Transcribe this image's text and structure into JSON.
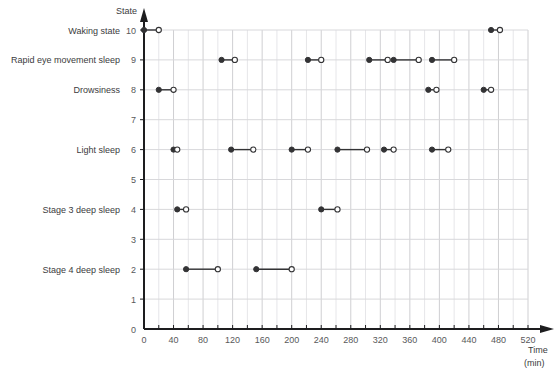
{
  "chart_data": {
    "type": "line",
    "title": "",
    "xlabel": "Time (min)",
    "ylabel": "State",
    "xlim": [
      0,
      520
    ],
    "ylim": [
      0,
      10
    ],
    "grid": true,
    "legend": "none",
    "x_major_step": 40,
    "x_minor_step": 20,
    "y_step": 1,
    "x_ticks": [
      0,
      40,
      80,
      120,
      160,
      200,
      240,
      280,
      320,
      360,
      400,
      440,
      480,
      520
    ],
    "x_tick_labels": [
      "0",
      "40",
      "80",
      "120",
      "160",
      "200",
      "240",
      "280",
      "320",
      "360",
      "400",
      "440",
      "480",
      "520"
    ],
    "y_ticks": [
      1,
      2,
      3,
      4,
      5,
      6,
      7,
      8,
      9,
      10
    ],
    "y_tick_labels": [
      "1",
      "2",
      "3",
      "4",
      "5",
      "6",
      "7",
      "8",
      "9",
      "10"
    ],
    "y_state_labels": [
      {
        "value": 10,
        "label": "Waking state"
      },
      {
        "value": 9,
        "label": "Rapid eye movement sleep"
      },
      {
        "value": 8,
        "label": "Drowsiness"
      },
      {
        "value": 6,
        "label": "Light sleep"
      },
      {
        "value": 4,
        "label": "Stage 3 deep sleep"
      },
      {
        "value": 2,
        "label": "Stage 4 deep sleep"
      }
    ],
    "marker_style": {
      "start": "filled-circle",
      "end": "open-circle",
      "color": "#333335",
      "line_color": "#333335"
    },
    "segments": [
      {
        "state": 10,
        "x_start": 0,
        "x_end": 20
      },
      {
        "state": 8,
        "x_start": 20,
        "x_end": 40
      },
      {
        "state": 6,
        "x_start": 40,
        "x_end": 45
      },
      {
        "state": 4,
        "x_start": 45,
        "x_end": 57
      },
      {
        "state": 2,
        "x_start": 57,
        "x_end": 100
      },
      {
        "state": 9,
        "x_start": 105,
        "x_end": 123
      },
      {
        "state": 6,
        "x_start": 118,
        "x_end": 148
      },
      {
        "state": 2,
        "x_start": 152,
        "x_end": 200
      },
      {
        "state": 6,
        "x_start": 200,
        "x_end": 222
      },
      {
        "state": 9,
        "x_start": 222,
        "x_end": 240
      },
      {
        "state": 4,
        "x_start": 240,
        "x_end": 262
      },
      {
        "state": 6,
        "x_start": 262,
        "x_end": 302
      },
      {
        "state": 9,
        "x_start": 305,
        "x_end": 330
      },
      {
        "state": 6,
        "x_start": 325,
        "x_end": 338
      },
      {
        "state": 9,
        "x_start": 338,
        "x_end": 372
      },
      {
        "state": 8,
        "x_start": 385,
        "x_end": 396
      },
      {
        "state": 9,
        "x_start": 390,
        "x_end": 420
      },
      {
        "state": 6,
        "x_start": 390,
        "x_end": 412
      },
      {
        "state": 8,
        "x_start": 460,
        "x_end": 470
      },
      {
        "state": 10,
        "x_start": 470,
        "x_end": 482
      }
    ]
  }
}
